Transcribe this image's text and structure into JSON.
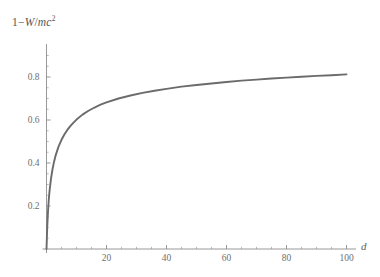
{
  "chart_data": {
    "type": "line",
    "title": "",
    "ylabel": "1 - W/mc^2",
    "ylabel_parts": {
      "one": "1",
      "minus": "−",
      "W": "W",
      "slash": "/",
      "mc": "mc",
      "exponent": "2"
    },
    "xlabel": "d",
    "xlim": [
      0,
      103
    ],
    "ylim": [
      0,
      0.95
    ],
    "grid": false,
    "legend": null,
    "xticks": [
      20,
      40,
      60,
      80,
      100
    ],
    "xtick_labels": [
      "20",
      "40",
      "60",
      "80",
      "100"
    ],
    "xminor_step": 5,
    "yticks": [
      0.2,
      0.4,
      0.6,
      0.8
    ],
    "ytick_labels": [
      "0.2",
      "0.4",
      "0.6",
      "0.8"
    ],
    "yminor_step": 0.05,
    "series": [
      {
        "name": "1 - W/mc^2",
        "color": "#6b6b6b",
        "x": [
          0,
          0.25,
          0.5,
          0.75,
          1,
          1.5,
          2,
          2.5,
          3,
          4,
          5,
          6,
          7,
          8,
          9,
          10,
          12,
          14,
          16,
          18,
          20,
          24,
          28,
          32,
          36,
          40,
          45,
          50,
          55,
          60,
          65,
          70,
          75,
          80,
          85,
          90,
          95,
          100
        ],
        "y": [
          0.0,
          0.105,
          0.175,
          0.228,
          0.268,
          0.327,
          0.371,
          0.405,
          0.433,
          0.476,
          0.508,
          0.534,
          0.555,
          0.573,
          0.588,
          0.602,
          0.625,
          0.643,
          0.658,
          0.671,
          0.682,
          0.7,
          0.714,
          0.726,
          0.736,
          0.745,
          0.755,
          0.763,
          0.77,
          0.777,
          0.783,
          0.788,
          0.793,
          0.797,
          0.801,
          0.805,
          0.808,
          0.812
        ]
      }
    ],
    "axis_color": "#8d8d8d",
    "background": "#ffffff"
  },
  "geometry": {
    "x0_px": 46.5,
    "y0_px": 249.0,
    "x_per_unit": 3.0,
    "y_per_unit": 215.0,
    "tick_len_major": 4.0,
    "tick_len_minor": 2.2,
    "x_axis_end_px": 356.0,
    "y_axis_top_px": 44.0
  }
}
